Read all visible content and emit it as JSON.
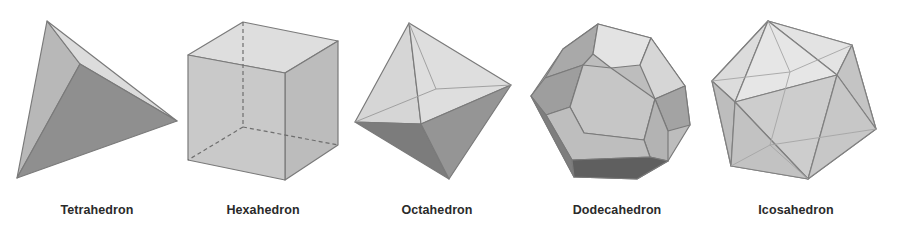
{
  "figure": {
    "solids": [
      {
        "name": "Tetrahedron",
        "label_x": 97
      },
      {
        "name": "Hexahedron",
        "label_x": 263
      },
      {
        "name": "Octahedron",
        "label_x": 437
      },
      {
        "name": "Dodecahedron",
        "label_x": 617
      },
      {
        "name": "Icosahedron",
        "label_x": 796
      }
    ],
    "colors": {
      "background": "#ffffff",
      "label": "#2a2a2a",
      "edge": "#7a7a7a",
      "face_light": "#d9d9d9",
      "face_mid": "#bdbdbd",
      "face_dark": "#8e8e8e",
      "face_darkest": "#6a6a6a"
    }
  }
}
